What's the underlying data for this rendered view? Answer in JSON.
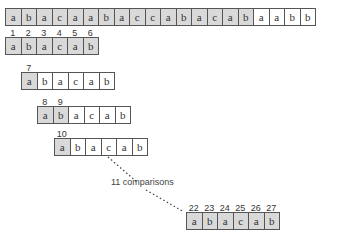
{
  "text_row": {
    "cells": [
      "a",
      "b",
      "a",
      "c",
      "a",
      "a",
      "b",
      "a",
      "c",
      "c",
      "a",
      "b",
      "a",
      "c",
      "a",
      "b",
      "a",
      "a",
      "b",
      "b"
    ],
    "shaded_count": 16
  },
  "pattern_rows": [
    {
      "offset": 0,
      "cells": [
        "a",
        "b",
        "a",
        "c",
        "a",
        "b"
      ],
      "shaded": [
        0,
        1,
        2,
        3,
        4,
        5
      ],
      "labels": [
        "1",
        "2",
        "3",
        "4",
        "5",
        "6"
      ]
    },
    {
      "offset": 1,
      "cells": [
        "a",
        "b",
        "a",
        "c",
        "a",
        "b"
      ],
      "shaded": [
        0
      ],
      "labels": [
        "7"
      ]
    },
    {
      "offset": 2,
      "cells": [
        "a",
        "b",
        "a",
        "c",
        "a",
        "b"
      ],
      "shaded": [
        0,
        1
      ],
      "labels": [
        "8",
        "9"
      ]
    },
    {
      "offset": 3,
      "cells": [
        "a",
        "b",
        "a",
        "c",
        "a",
        "b"
      ],
      "shaded": [
        0
      ],
      "labels": [
        "10"
      ]
    },
    {
      "offset": 11,
      "cells": [
        "a",
        "b",
        "a",
        "c",
        "a",
        "b"
      ],
      "shaded": [
        0,
        1,
        2,
        3,
        4,
        5
      ],
      "labels": [
        "22",
        "23",
        "24",
        "25",
        "26",
        "27"
      ]
    }
  ],
  "annotation": "11 comparisons"
}
